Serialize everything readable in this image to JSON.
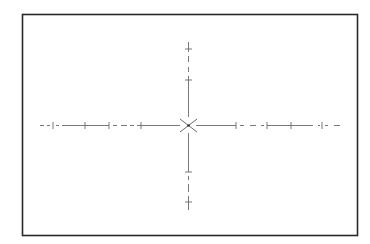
{
  "diagram": {
    "type": "reticle",
    "colors": {
      "frame": "#2a2a2a",
      "lines": "#6a6a6a",
      "background": "#ffffff"
    },
    "frame": {
      "x": 22,
      "y": 14,
      "width": 335,
      "height": 221
    },
    "center": {
      "x": 188,
      "y": 125
    },
    "horizontal_ticks_x": [
      53,
      85,
      109,
      141,
      236,
      267,
      291,
      322
    ],
    "vertical_ticks_y": [
      49,
      80,
      172,
      202
    ],
    "horizontal_extent": [
      40,
      340
    ],
    "vertical_extent": [
      42,
      210
    ]
  }
}
